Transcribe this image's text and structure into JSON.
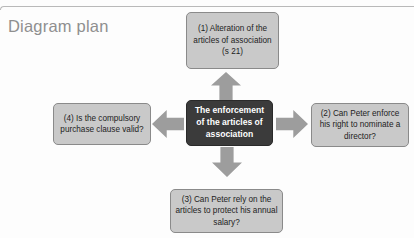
{
  "page": {
    "title": "Diagram plan"
  },
  "diagram": {
    "center": {
      "id": "center-node",
      "text": "The enforcement of the articles of association"
    },
    "nodes": [
      {
        "id": "node-top",
        "position": "top",
        "number": "(1)",
        "text": "(1) Alteration of the articles of association (s 21)"
      },
      {
        "id": "node-right",
        "position": "right",
        "number": "(2)",
        "text": "(2) Can Peter enforce his right to nominate a director?"
      },
      {
        "id": "node-bottom",
        "position": "bottom",
        "number": "(3)",
        "text": "(3) Can Peter rely on the articles to protect his annual salary?"
      },
      {
        "id": "node-left",
        "position": "left",
        "number": "(4)",
        "text": "(4) Is the compulsory purchase clause valid?"
      }
    ],
    "arrows": [
      {
        "id": "arrow-up",
        "direction": "up",
        "from": "center-node",
        "to": "node-top"
      },
      {
        "id": "arrow-right",
        "direction": "right",
        "from": "center-node",
        "to": "node-right"
      },
      {
        "id": "arrow-down",
        "direction": "down",
        "from": "center-node",
        "to": "node-bottom"
      },
      {
        "id": "arrow-left",
        "direction": "left",
        "from": "center-node",
        "to": "node-left"
      }
    ]
  },
  "colors": {
    "node_fill": "#c9c9c9",
    "node_border": "#8a8a8a",
    "center_fill": "#3b3b3b",
    "center_text": "#ffffff",
    "arrow_fill": "#9d9d9d",
    "title_text": "#8f8f8f",
    "background": "#fdfdfd"
  }
}
